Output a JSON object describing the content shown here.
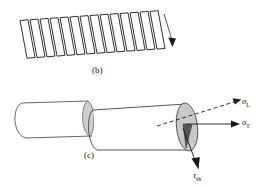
{
  "figure": {
    "panels": [
      {
        "id": "b",
        "caption": "(b)",
        "description": "sheared lamellar accordion structure with shear direction arrow",
        "lamella_count": 13,
        "arrow": {
          "name": "shear-direction-arrow",
          "direction": "down"
        }
      },
      {
        "id": "c",
        "caption": "(c)",
        "description": "cylinder sheared into two offset halves with stress vectors",
        "vectors": [
          {
            "name": "sigma-L",
            "symbol": "σ",
            "subscript": "L",
            "style": "dashed",
            "direction": "up-right"
          },
          {
            "name": "sigma-T",
            "symbol": "σ",
            "subscript": "T",
            "style": "solid",
            "direction": "right"
          },
          {
            "name": "tau-sh",
            "symbol": "τ",
            "subscript": "sh",
            "style": "solid",
            "direction": "down"
          }
        ]
      }
    ]
  },
  "labels": {
    "caption_b": "(b)",
    "caption_c": "(c)",
    "sigma_L_symbol": "σ",
    "sigma_L_sub": "L",
    "sigma_T_symbol": "σ",
    "sigma_T_sub": "T",
    "tau_symbol": "τ",
    "tau_sub": "sh"
  },
  "colors": {
    "stroke": "#1a1a1a",
    "fill": "#ffffff",
    "ellipse_shade": "#c9c9c9",
    "wedge_shade": "#5a5a5a",
    "background": "#ffffff"
  }
}
